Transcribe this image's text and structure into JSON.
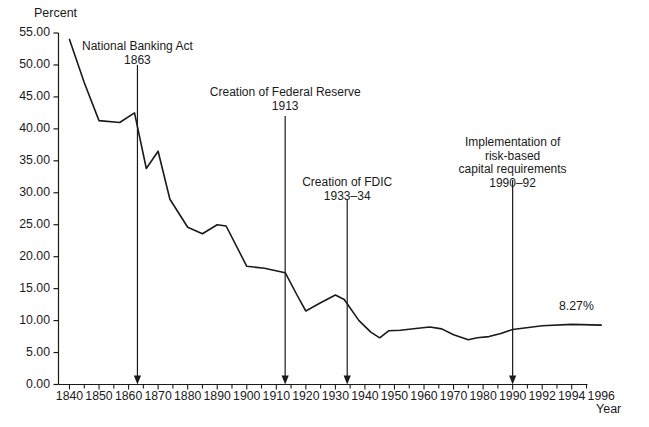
{
  "chart_data": {
    "type": "line",
    "title": "",
    "subtitle": "",
    "xlabel": "Year",
    "ylabel": "Percent",
    "grid": false,
    "legend": null,
    "xlim": [
      1840,
      1996
    ],
    "ylim": [
      0.0,
      55.0
    ],
    "y_tick_labels": [
      "0.00",
      "5.00",
      "10.00",
      "15.00",
      "20.00",
      "25.00",
      "30.00",
      "35.00",
      "40.00",
      "45.00",
      "50.00",
      "55.00"
    ],
    "y_tick_values": [
      0,
      5,
      10,
      15,
      20,
      25,
      30,
      35,
      40,
      45,
      50,
      55
    ],
    "x_tick_labels": [
      "1840",
      "1850",
      "1860",
      "1870",
      "1880",
      "1890",
      "1900",
      "1910",
      "1920",
      "1930",
      "1940",
      "1950",
      "1960",
      "1970",
      "1980",
      "1990",
      "1992",
      "1994",
      "1996"
    ],
    "x_tick_values": [
      1840,
      1850,
      1860,
      1870,
      1880,
      1890,
      1900,
      1910,
      1920,
      1930,
      1940,
      1950,
      1960,
      1970,
      1980,
      1990,
      1992,
      1994,
      1996
    ],
    "minor_tick_interval": 2,
    "series": [
      {
        "name": "Capital ratio",
        "x": [
          1840,
          1845,
          1850,
          1857,
          1862,
          1866,
          1870,
          1874,
          1880,
          1885,
          1890,
          1893,
          1900,
          1906,
          1913,
          1917,
          1920,
          1925,
          1930,
          1933,
          1938,
          1942,
          1945,
          1948,
          1952,
          1958,
          1962,
          1966,
          1970,
          1975,
          1978,
          1982,
          1986,
          1990,
          1992,
          1994,
          1996
        ],
        "y": [
          54.0,
          47.2,
          41.3,
          41.0,
          42.5,
          33.8,
          36.5,
          29.0,
          24.6,
          23.6,
          25.0,
          24.8,
          18.5,
          18.2,
          17.5,
          14.0,
          11.5,
          12.8,
          14.0,
          13.3,
          10.0,
          8.2,
          7.3,
          8.4,
          8.5,
          8.8,
          9.0,
          8.7,
          7.8,
          7.0,
          7.3,
          7.5,
          8.0,
          8.6,
          9.2,
          9.4,
          9.3
        ]
      }
    ],
    "end_value_label": "8.27%",
    "annotations": [
      {
        "id": "national-banking-act",
        "lines": [
          "National Banking Act",
          "1863"
        ],
        "event_year": 1863,
        "label_year": 1863,
        "arrow_from_percent": 50.0,
        "arrow_to_percent": 0.0
      },
      {
        "id": "creation-of-federal-reserve",
        "lines": [
          "Creation of Federal Reserve",
          "1913"
        ],
        "event_year": 1913,
        "label_year": 1913,
        "arrow_from_percent": 42.0,
        "arrow_to_percent": 0.0
      },
      {
        "id": "creation-of-fdic",
        "lines": [
          "Creation of FDIC",
          "1933–34"
        ],
        "event_year": 1934,
        "label_year": 1934,
        "arrow_from_percent": 29.0,
        "arrow_to_percent": 0.0
      },
      {
        "id": "risk-based-capital-requirements",
        "lines": [
          "Implementation of",
          "risk-based",
          "capital requirements",
          "1990–92"
        ],
        "event_year": 1990,
        "label_year": 1990,
        "arrow_from_percent": 32.0,
        "arrow_to_percent": 0.0
      }
    ],
    "colors": {
      "line": "#1a1a1a",
      "axis": "#1a1a1a",
      "text": "#1a1a1a",
      "background": "#ffffff"
    }
  },
  "axes": {
    "y_title": "Percent",
    "x_title": "Year"
  },
  "annotation_text": {
    "a0": {
      "l0": "National Banking Act",
      "l1": "1863"
    },
    "a1": {
      "l0": "Creation of Federal Reserve",
      "l1": "1913"
    },
    "a2": {
      "l0": "Creation of FDIC",
      "l1": "1933–34"
    },
    "a3": {
      "l0": "Implementation of",
      "l1": "risk-based",
      "l2": "capital requirements",
      "l3": "1990–92"
    }
  },
  "end_label": "8.27%"
}
